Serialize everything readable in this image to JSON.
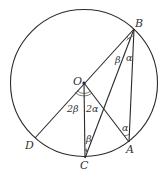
{
  "diagram": {
    "type": "geometry-circle",
    "colors": {
      "stroke": "#2a2a2a",
      "text": "#333333",
      "background": "#ffffff"
    },
    "circle": {
      "center": "O"
    },
    "points": {
      "O": {
        "label": "O"
      },
      "A": {
        "label": "A"
      },
      "B": {
        "label": "B"
      },
      "C": {
        "label": "C"
      },
      "D": {
        "label": "D"
      }
    },
    "segments": [
      "B-D",
      "O-C",
      "O-A",
      "B-C",
      "B-A"
    ],
    "angles": {
      "DOC": "2β",
      "COA": "2α",
      "OBC": "β",
      "CBA": "α",
      "OAB": "α",
      "OCB": "β"
    }
  }
}
